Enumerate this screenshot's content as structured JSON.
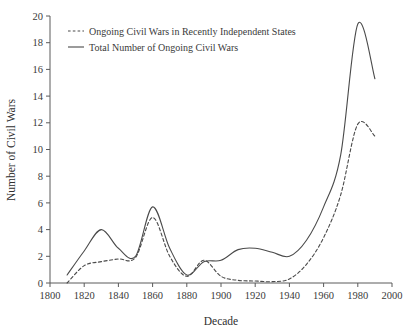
{
  "chart_data": {
    "type": "line",
    "title": "",
    "xlabel": "Decade",
    "ylabel": "Number of Civil Wars",
    "xlim": [
      1800,
      2000
    ],
    "ylim": [
      0,
      20
    ],
    "xticks": [
      1800,
      1820,
      1840,
      1860,
      1880,
      1900,
      1920,
      1940,
      1960,
      1980,
      2000
    ],
    "yticks": [
      0,
      2,
      4,
      6,
      8,
      10,
      12,
      14,
      16,
      18,
      20
    ],
    "grid": false,
    "legend_position": "top-left",
    "x": [
      1810,
      1820,
      1830,
      1840,
      1850,
      1860,
      1870,
      1880,
      1890,
      1900,
      1910,
      1920,
      1930,
      1940,
      1950,
      1960,
      1970,
      1980,
      1990
    ],
    "series": [
      {
        "name": "Ongoing Civil Wars in Recently Independent States",
        "style": "dashed",
        "color": "#4a4a4a",
        "values": [
          0.0,
          1.3,
          1.6,
          1.8,
          1.9,
          4.9,
          2.0,
          0.5,
          1.7,
          0.5,
          0.2,
          0.15,
          0.1,
          0.3,
          1.4,
          3.4,
          6.6,
          11.9,
          11.0
        ]
      },
      {
        "name": "Total Number of Ongoing Civil Wars",
        "style": "solid",
        "color": "#4a4a4a",
        "values": [
          0.6,
          2.4,
          4.0,
          2.6,
          2.0,
          5.7,
          2.6,
          0.6,
          1.6,
          1.7,
          2.5,
          2.6,
          2.3,
          2.0,
          3.2,
          5.7,
          9.6,
          19.4,
          15.3
        ]
      }
    ]
  },
  "legend": {
    "entries": [
      {
        "label": "Ongoing Civil Wars in Recently Independent States",
        "style": "dashed"
      },
      {
        "label": "Total Number of Ongoing Civil Wars",
        "style": "solid"
      }
    ]
  },
  "axis": {
    "x_title": "Decade",
    "y_title": "Number of Civil Wars",
    "x_tick_labels": [
      "1800",
      "1820",
      "1840",
      "1860",
      "1880",
      "1900",
      "1920",
      "1940",
      "1960",
      "1980",
      "2000"
    ],
    "y_tick_labels": [
      "0",
      "2",
      "4",
      "6",
      "8",
      "10",
      "12",
      "14",
      "16",
      "18",
      "20"
    ]
  },
  "colors": {
    "line": "#4a4a4a",
    "axis": "#5a5a5a",
    "text": "#3a3a3a",
    "background": "#ffffff"
  }
}
